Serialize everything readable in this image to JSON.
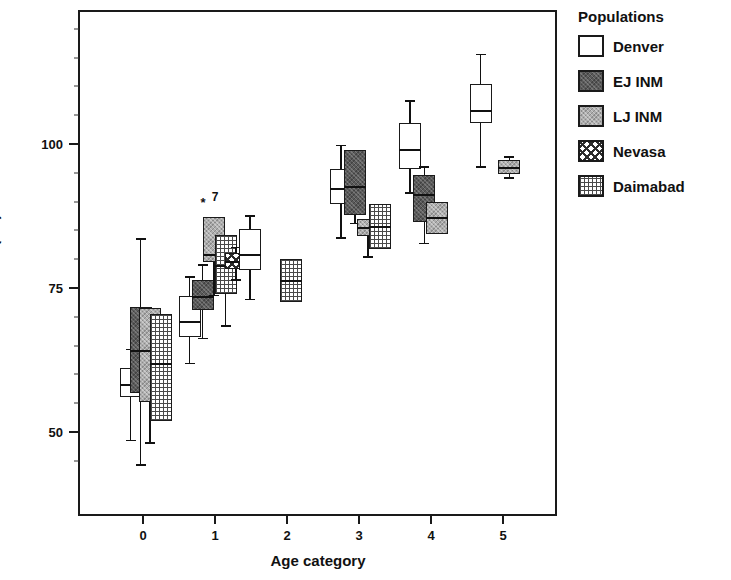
{
  "chart_data": {
    "type": "box",
    "title": "",
    "xlabel": "Age category",
    "ylabel": "Stature (cm)",
    "ylim": [
      38,
      123
    ],
    "yticks": [
      50,
      75,
      100
    ],
    "xlim": [
      -0.5,
      5.6
    ],
    "xticks": [
      0,
      1,
      2,
      3,
      4,
      5
    ],
    "xtick_labels": [
      "0",
      "1",
      "2",
      "3",
      "4",
      "5"
    ],
    "grid": false,
    "legend_position": "right",
    "legend_title": "Populations",
    "series": [
      {
        "name": "Denver",
        "fill": "open",
        "color": "#ffffff"
      },
      {
        "name": "EJ INM",
        "fill": "dark-stipple",
        "color": "#5a5a5a"
      },
      {
        "name": "LJ INM",
        "fill": "gray-stipple",
        "color": "#adadad"
      },
      {
        "name": "Nevasa",
        "fill": "cross-hatch",
        "color": "#ffffff"
      },
      {
        "name": "Daimabad",
        "fill": "dotted-grid",
        "color": "#ffffff"
      }
    ],
    "boxes": [
      {
        "population": "Denver",
        "age": 0,
        "x": -0.2,
        "whisker_low": 49.0,
        "q1": 56.4,
        "median": 58.6,
        "q3": 61.5,
        "whisker_high": 64.8
      },
      {
        "population": "EJ INM",
        "age": 0,
        "x": -0.06,
        "whisker_low": 44.8,
        "q1": 57.1,
        "median": 64.5,
        "q3": 72.0,
        "whisker_high": 84.0
      },
      {
        "population": "LJ INM",
        "age": 0,
        "x": 0.07,
        "whisker_low": 48.6,
        "q1": 55.5,
        "median": 64.6,
        "q3": 71.9,
        "whisker_high": 71.9
      },
      {
        "population": "Daimabad",
        "age": 0,
        "x": 0.22,
        "whisker_low": 52.2,
        "q1": 52.2,
        "median": 62.3,
        "q3": 70.8,
        "whisker_high": 70.8
      },
      {
        "population": "Denver",
        "age": 1,
        "x": 0.62,
        "whisker_low": 62.4,
        "q1": 66.8,
        "median": 69.6,
        "q3": 74.0,
        "whisker_high": 77.4
      },
      {
        "population": "EJ INM",
        "age": 1,
        "x": 0.8,
        "whisker_low": 66.7,
        "q1": 71.6,
        "median": 74.0,
        "q3": 76.8,
        "whisker_high": 79.5
      },
      {
        "population": "LJ INM",
        "age": 1,
        "x": 0.96,
        "whisker_low": 74.2,
        "q1": 79.8,
        "median": 81.3,
        "q3": 87.6,
        "whisker_high": 87.6,
        "outliers": [
          {
            "value": 90.2,
            "marker": "*",
            "label": "7"
          }
        ]
      },
      {
        "population": "Daimabad",
        "age": 1,
        "x": 1.12,
        "whisker_low": 68.9,
        "q1": 74.3,
        "median": 79.3,
        "q3": 84.6,
        "whisker_high": 84.6
      },
      {
        "population": "Nevasa",
        "age": 1,
        "x": 1.26,
        "whisker_low": 76.9,
        "q1": 78.7,
        "median": 80.0,
        "q3": 81.4,
        "whisker_high": 82.5
      },
      {
        "population": "Denver",
        "age": 1,
        "x": 1.46,
        "whisker_low": 73.5,
        "q1": 78.4,
        "median": 81.2,
        "q3": 85.6,
        "whisker_high": 88.0
      },
      {
        "population": "Daimabad",
        "age": 2,
        "x": 2.03,
        "whisker_low": 73.0,
        "q1": 73.0,
        "median": 76.7,
        "q3": 80.4,
        "whisker_high": 80.4
      },
      {
        "population": "Denver",
        "age": 3,
        "x": 2.72,
        "whisker_low": 84.2,
        "q1": 90.0,
        "median": 92.7,
        "q3": 96.0,
        "whisker_high": 100.2
      },
      {
        "population": "EJ INM",
        "age": 3,
        "x": 2.92,
        "whisker_low": 86.7,
        "q1": 88.1,
        "median": 93.1,
        "q3": 99.3,
        "whisker_high": 99.3
      },
      {
        "population": "LJ INM",
        "age": 3,
        "x": 3.1,
        "whisker_low": 80.9,
        "q1": 84.4,
        "median": 85.9,
        "q3": 87.4,
        "whisker_high": 87.4
      },
      {
        "population": "Daimabad",
        "age": 3,
        "x": 3.26,
        "whisker_low": 82.1,
        "q1": 82.1,
        "median": 86.1,
        "q3": 90.0,
        "whisker_high": 90.0
      },
      {
        "population": "Denver",
        "age": 4,
        "x": 3.68,
        "whisker_low": 92.0,
        "q1": 96.0,
        "median": 99.4,
        "q3": 104.0,
        "whisker_high": 108.0
      },
      {
        "population": "EJ INM",
        "age": 4,
        "x": 3.88,
        "whisker_low": 83.2,
        "q1": 86.8,
        "median": 91.7,
        "q3": 95.0,
        "whisker_high": 96.5
      },
      {
        "population": "LJ INM",
        "age": 4,
        "x": 4.06,
        "whisker_low": 84.8,
        "q1": 84.8,
        "median": 87.6,
        "q3": 90.3,
        "whisker_high": 90.3
      },
      {
        "population": "Denver",
        "age": 5,
        "x": 4.66,
        "whisker_low": 96.5,
        "q1": 104.0,
        "median": 106.2,
        "q3": 110.8,
        "whisker_high": 116.0
      },
      {
        "population": "LJ INM",
        "age": 5,
        "x": 5.06,
        "whisker_low": 94.6,
        "q1": 95.2,
        "median": 96.3,
        "q3": 97.5,
        "whisker_high": 98.2
      }
    ]
  },
  "legend": {
    "title": "Populations",
    "items": [
      {
        "label": "Denver"
      },
      {
        "label": "EJ INM"
      },
      {
        "label": "LJ INM"
      },
      {
        "label": "Nevasa"
      },
      {
        "label": "Daimabad"
      }
    ]
  },
  "axes": {
    "y_title": "Stature (cm)",
    "x_title": "Age category",
    "y_tick_labels": [
      "100",
      "75",
      "50"
    ],
    "x_tick_labels": [
      "0",
      "1",
      "2",
      "3",
      "4",
      "5"
    ]
  }
}
